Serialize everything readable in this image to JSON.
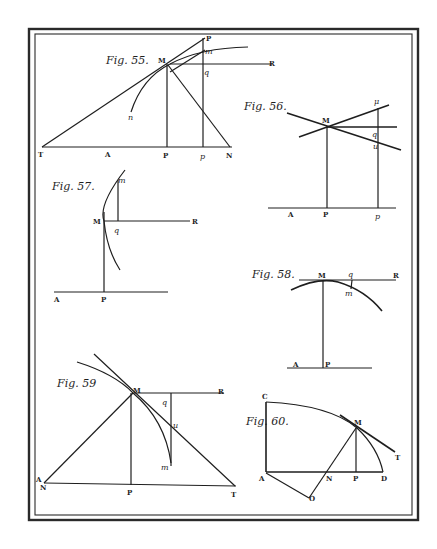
{
  "plate": {
    "background": "#ffffff",
    "ink": "#1e1e1e"
  },
  "figures": {
    "fig55": {
      "title": "Fig. 55.",
      "labels": {
        "M": "M",
        "R": "R",
        "P_top": "P",
        "m": "m",
        "q": "q",
        "n": "n",
        "T": "T",
        "A": "A",
        "P": "P",
        "p": "p",
        "N": "N"
      }
    },
    "fig56": {
      "title": "Fig. 56.",
      "labels": {
        "mu": "μ",
        "M": "M",
        "q": "q",
        "u": "u",
        "A": "A",
        "P": "P",
        "p": "p"
      }
    },
    "fig57": {
      "title": "Fig. 57.",
      "labels": {
        "m": "m",
        "M": "M",
        "R": "R",
        "q": "q",
        "A": "A",
        "P": "P"
      }
    },
    "fig58": {
      "title": "Fig. 58.",
      "labels": {
        "M": "M",
        "q": "q",
        "R": "R",
        "m": "m",
        "A": "A",
        "P": "P"
      }
    },
    "fig59": {
      "title": "Fig. 59",
      "labels": {
        "M": "M",
        "R": "R",
        "q": "q",
        "u": "u",
        "m": "m",
        "A": "A",
        "N": "N",
        "P": "P",
        "T": "T"
      }
    },
    "fig60": {
      "title": "Fig. 60.",
      "labels": {
        "C": "C",
        "M": "M",
        "T": "T",
        "A": "A",
        "N": "N",
        "P": "P",
        "D": "D",
        "O": "O"
      }
    }
  }
}
